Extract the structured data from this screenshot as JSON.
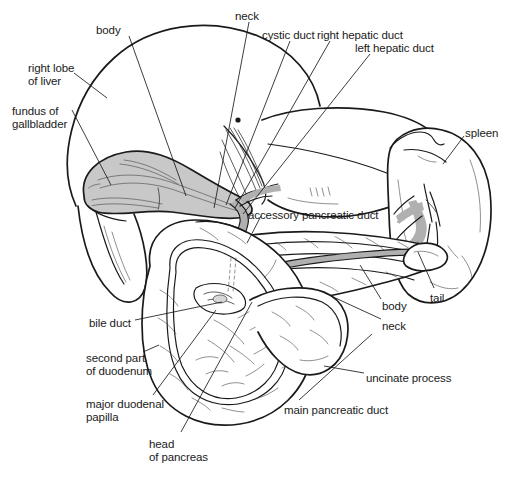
{
  "figure": {
    "background": "#ffffff",
    "line_color": "#1a1a1a",
    "gallbladder_fill": "#c8c8c8",
    "duct_fill": "#b4b4b4",
    "shadow_fill": "#f0f0f0"
  },
  "labels": {
    "body_liver": "body",
    "neck_gb": "neck",
    "cystic_duct": "cystic duct",
    "right_hepatic_duct": "right hepatic duct",
    "left_hepatic_duct": "left hepatic duct",
    "right_lobe_of_liver": "right lobe\nof liver",
    "fundus_of_gallbladder": "fundus of\ngallbladder",
    "spleen": "spleen",
    "accessory_pancreatic_duct": "accessory pancreatic duct",
    "body_pancreas": "body",
    "neck_pancreas": "neck",
    "tail": "tail",
    "bile_duct": "bile duct",
    "second_part_of_duodenum": "second part\nof duodenum",
    "major_duodenal_papilla": "major duodenal\npapilla",
    "head_of_pancreas": "head\nof pancreas",
    "main_pancreatic_duct": "main pancreatic duct",
    "uncinate_process": "uncinate process"
  },
  "label_positions": {
    "body_liver": {
      "x": 96,
      "y": 24,
      "align": "left"
    },
    "neck_gb": {
      "x": 235,
      "y": 10,
      "align": "left"
    },
    "cystic_duct": {
      "x": 262,
      "y": 29,
      "align": "left"
    },
    "right_hepatic_duct": {
      "x": 317,
      "y": 29,
      "align": "left"
    },
    "left_hepatic_duct": {
      "x": 355,
      "y": 42,
      "align": "left"
    },
    "right_lobe_of_liver": {
      "x": 28,
      "y": 62,
      "align": "left"
    },
    "fundus_of_gallbladder": {
      "x": 12,
      "y": 105,
      "align": "left"
    },
    "spleen": {
      "x": 465,
      "y": 127,
      "align": "left"
    },
    "accessory_pancreatic_duct": {
      "x": 248,
      "y": 209,
      "align": "left"
    },
    "body_pancreas": {
      "x": 382,
      "y": 300,
      "align": "left"
    },
    "neck_pancreas": {
      "x": 382,
      "y": 320,
      "align": "left"
    },
    "tail": {
      "x": 430,
      "y": 292,
      "align": "left"
    },
    "bile_duct": {
      "x": 89,
      "y": 317,
      "align": "left"
    },
    "second_part_of_duodenum": {
      "x": 86,
      "y": 352,
      "align": "left"
    },
    "major_duodenal_papilla": {
      "x": 86,
      "y": 398,
      "align": "left"
    },
    "head_of_pancreas": {
      "x": 149,
      "y": 438,
      "align": "left"
    },
    "main_pancreatic_duct": {
      "x": 284,
      "y": 404,
      "align": "left"
    },
    "uncinate_process": {
      "x": 366,
      "y": 372,
      "align": "left"
    }
  },
  "leader_lines": [
    {
      "name": "body-liver-leader",
      "x1": 129,
      "y1": 36,
      "x2": 186,
      "y2": 196
    },
    {
      "name": "neck-gb-leader",
      "x1": 249,
      "y1": 22,
      "x2": 214,
      "y2": 208
    },
    {
      "name": "cystic-duct-leader",
      "x1": 290,
      "y1": 41,
      "x2": 226,
      "y2": 205
    },
    {
      "name": "right-hepatic-duct-leader",
      "x1": 330,
      "y1": 41,
      "x2": 235,
      "y2": 208
    },
    {
      "name": "left-hepatic-duct-leader",
      "x1": 370,
      "y1": 54,
      "x2": 243,
      "y2": 214
    },
    {
      "name": "right-lobe-leader",
      "x1": 74,
      "y1": 73,
      "x2": 107,
      "y2": 98
    },
    {
      "name": "fundus-leader",
      "x1": 72,
      "y1": 110,
      "x2": 111,
      "y2": 185
    },
    {
      "name": "spleen-leader",
      "x1": 464,
      "y1": 136,
      "x2": 443,
      "y2": 164
    },
    {
      "name": "accessory-duct-leader",
      "x1": 261,
      "y1": 216,
      "x2": 247,
      "y2": 243
    },
    {
      "name": "body-pancreas-leader",
      "x1": 381,
      "y1": 299,
      "x2": 360,
      "y2": 265
    },
    {
      "name": "neck-pancreas-leader",
      "x1": 381,
      "y1": 319,
      "x2": 318,
      "y2": 290
    },
    {
      "name": "tail-leader",
      "x1": 434,
      "y1": 288,
      "x2": 418,
      "y2": 252
    },
    {
      "name": "bile-duct-leader",
      "x1": 135,
      "y1": 320,
      "x2": 222,
      "y2": 302
    },
    {
      "name": "second-part-leader",
      "x1": 143,
      "y1": 352,
      "x2": 159,
      "y2": 345
    },
    {
      "name": "major-papilla-leader",
      "x1": 153,
      "y1": 395,
      "x2": 216,
      "y2": 310
    },
    {
      "name": "head-pancreas-leader",
      "x1": 181,
      "y1": 432,
      "x2": 252,
      "y2": 302
    },
    {
      "name": "main-duct-leader",
      "x1": 299,
      "y1": 400,
      "x2": 372,
      "y2": 334
    },
    {
      "name": "uncinate-leader",
      "x1": 364,
      "y1": 373,
      "x2": 324,
      "y2": 366
    }
  ]
}
